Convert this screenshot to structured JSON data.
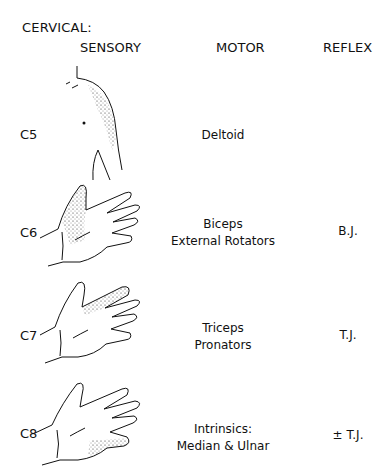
{
  "title": "CERVICAL:",
  "headers": {
    "sensory": "SENSORY",
    "motor": "MOTOR",
    "reflex": "REFLEX"
  },
  "rows": [
    {
      "level": "C5",
      "motor_lines": [
        "Deltoid"
      ],
      "reflex": "",
      "sensory_area": "lateral shoulder / deltoid region"
    },
    {
      "level": "C6",
      "motor_lines": [
        "Biceps",
        "External Rotators"
      ],
      "reflex": "B.J.",
      "sensory_area": "thumb and radial side of hand"
    },
    {
      "level": "C7",
      "motor_lines": [
        "Triceps",
        "Pronators"
      ],
      "reflex": "T.J.",
      "sensory_area": "middle finger"
    },
    {
      "level": "C8",
      "motor_lines": [
        "Intrinsics:",
        "Median & Ulnar"
      ],
      "reflex": "± T.J.",
      "sensory_area": "little finger and ulnar side of hand"
    }
  ]
}
